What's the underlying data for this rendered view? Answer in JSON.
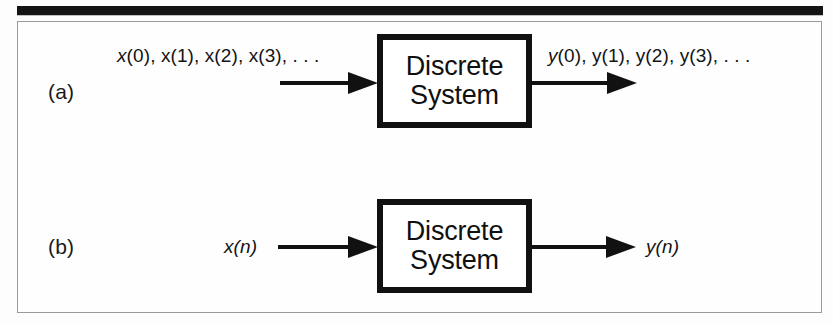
{
  "figure": {
    "background_color": "#fdfdfd",
    "rule_color": "#141414",
    "frame_color": "#9a9a9a",
    "ink_color": "#111111",
    "parts": [
      {
        "id": "a",
        "label": "(a)",
        "input_signal": "x(0), x(1), x(2), x(3), . . .",
        "input_signal_var": "x",
        "input_signal_rest": "(0), x(1), x(2), x(3), . . .",
        "output_signal": "y(0), y(1), y(2), y(3), . . .",
        "output_signal_var": "y",
        "output_signal_rest": "(0), y(1), y(2), y(3), . . .",
        "block_line_1": "Discrete",
        "block_line_2": "System"
      },
      {
        "id": "b",
        "label": "(b)",
        "input_signal": "x(n)",
        "input_signal_var": "x",
        "input_signal_rest": "(n)",
        "output_signal": "y(n)",
        "output_signal_var": "y",
        "output_signal_rest": "(n)",
        "block_line_1": "Discrete",
        "block_line_2": "System"
      }
    ]
  }
}
